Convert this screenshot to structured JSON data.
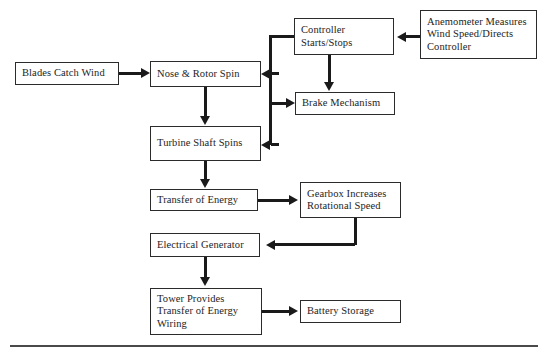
{
  "diagram": {
    "stroke_color": "#1a1a1a",
    "box_border_color": "#2b2b2b",
    "background_color": "#ffffff",
    "footer_rule_color": "#4a4a4a",
    "nodes": [
      {
        "id": "blades",
        "name": "blades-catch-wind",
        "lines": [
          "Blades Catch Wind"
        ],
        "x": 15,
        "y": 62,
        "w": 104,
        "h": 23
      },
      {
        "id": "nose_rotor",
        "name": "nose-and-rotor-spin",
        "lines": [
          "Nose & Rotor Spin"
        ],
        "x": 150,
        "y": 61,
        "w": 111,
        "h": 26
      },
      {
        "id": "turbine_shaft",
        "name": "turbine-shaft-spins",
        "lines": [
          "Turbine Shaft Spins"
        ],
        "x": 150,
        "y": 126,
        "w": 111,
        "h": 35
      },
      {
        "id": "transfer_energy",
        "name": "transfer-of-energy",
        "lines": [
          "Transfer of Energy"
        ],
        "x": 150,
        "y": 189,
        "w": 108,
        "h": 22
      },
      {
        "id": "electrical_generator",
        "name": "electrical-generator",
        "lines": [
          "Electrical Generator"
        ],
        "x": 150,
        "y": 233,
        "w": 110,
        "h": 24
      },
      {
        "id": "tower",
        "name": "tower-provides-transfer-of-energy-wiring",
        "lines": [
          "Tower Provides",
          "Transfer of Energy",
          "Wiring"
        ],
        "x": 150,
        "y": 288,
        "w": 112,
        "h": 47
      },
      {
        "id": "controller",
        "name": "controller-starts-stops",
        "lines": [
          "Controller",
          "Starts/Stops"
        ],
        "x": 294,
        "y": 18,
        "w": 100,
        "h": 37
      },
      {
        "id": "brake",
        "name": "brake-mechanism",
        "lines": [
          "Brake Mechanism"
        ],
        "x": 295,
        "y": 92,
        "w": 100,
        "h": 23
      },
      {
        "id": "anemometer",
        "name": "anemometer-measures-wind-speed-directs-controller",
        "lines": [
          "Anemometer Measures",
          "Wind Speed/Directs",
          "Controller"
        ],
        "x": 420,
        "y": 10,
        "w": 117,
        "h": 49
      },
      {
        "id": "gearbox",
        "name": "gearbox-increases-rotational-speed",
        "lines": [
          "Gearbox Increases",
          "Rotational Speed"
        ],
        "x": 300,
        "y": 182,
        "w": 101,
        "h": 36
      },
      {
        "id": "battery",
        "name": "battery-storage",
        "lines": [
          "Battery Storage"
        ],
        "x": 300,
        "y": 300,
        "w": 101,
        "h": 23
      }
    ],
    "connections": [
      {
        "name": "blades-to-nose",
        "from": "blades",
        "to": "nose_rotor"
      },
      {
        "name": "nose-to-turbine-shaft",
        "from": "nose_rotor",
        "to": "turbine_shaft"
      },
      {
        "name": "turbine-shaft-to-transfer",
        "from": "turbine_shaft",
        "to": "transfer_energy"
      },
      {
        "name": "transfer-to-gearbox",
        "from": "transfer_energy",
        "to": "gearbox"
      },
      {
        "name": "gearbox-to-generator",
        "from": "gearbox",
        "to": "electrical_generator"
      },
      {
        "name": "generator-to-tower",
        "from": "electrical_generator",
        "to": "tower"
      },
      {
        "name": "tower-to-battery",
        "from": "tower",
        "to": "battery"
      },
      {
        "name": "anemometer-to-controller",
        "from": "anemometer",
        "to": "controller"
      },
      {
        "name": "controller-to-brake",
        "from": "controller",
        "to": "brake"
      },
      {
        "name": "controller-to-nose",
        "from": "controller",
        "to": "nose_rotor"
      },
      {
        "name": "controller-to-turbine-shaft",
        "from": "controller",
        "to": "turbine_shaft"
      },
      {
        "name": "controller-trunk-to-brake",
        "from": "controller",
        "to": "brake"
      }
    ],
    "footer_rule": {
      "name": "footer-divider",
      "x": 10,
      "y": 345,
      "w": 528
    }
  }
}
